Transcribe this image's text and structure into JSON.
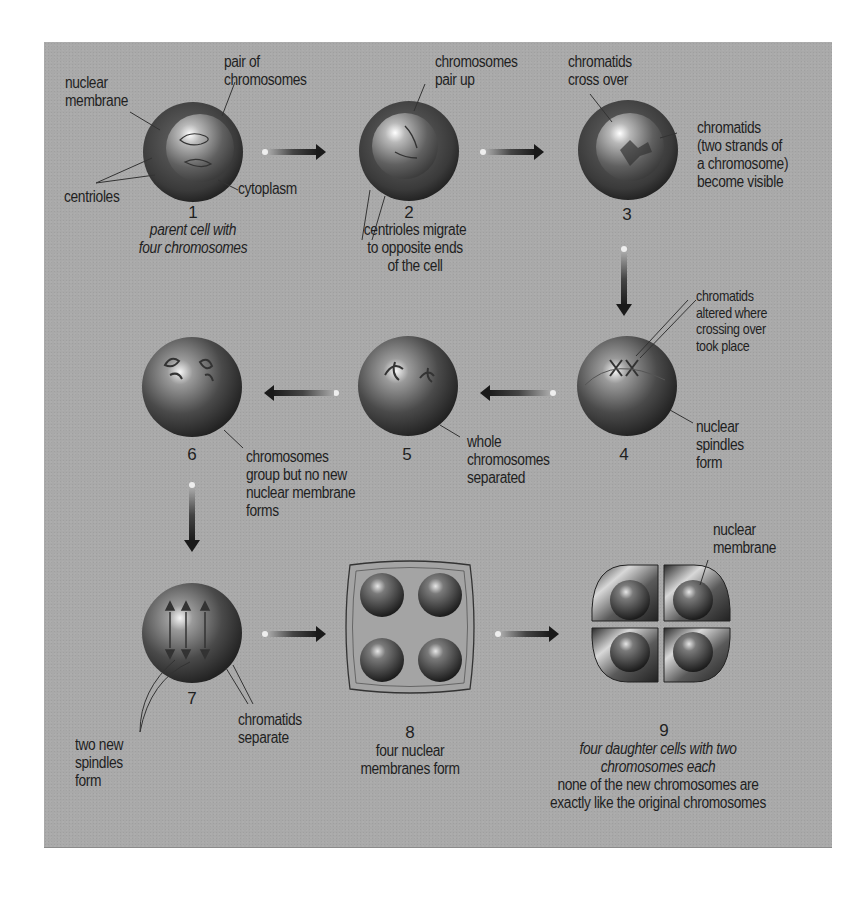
{
  "diagram": {
    "type": "process-flow",
    "topic": "Meiosis",
    "background_color": "#a9a9a9",
    "text_color": "#1f1f1f",
    "flow_order": [
      1,
      2,
      3,
      4,
      5,
      6,
      7,
      8,
      9
    ],
    "stages": [
      {
        "number": "1",
        "caption": "parent cell with\nfour chromosomes",
        "caption_style": "italic",
        "labels": {
          "nuclear_membrane": "nuclear\nmembrane",
          "pair_of_chromosomes": "pair of\nchromosomes",
          "centrioles": "centrioles",
          "cytoplasm": "cytoplasm"
        }
      },
      {
        "number": "2",
        "caption": "centrioles migrate\nto opposite ends\nof the cell",
        "labels": {
          "chromosomes_pair_up": "chromosomes\npair up"
        }
      },
      {
        "number": "3",
        "labels": {
          "chromatids_cross_over": "chromatids\ncross over",
          "chromatids_visible": "chromatids\n(two strands of\na chromosome)\nbecome visible"
        }
      },
      {
        "number": "4",
        "labels": {
          "chromatids_altered": "chromatids\naltered where\ncrossing over\ntook place",
          "nuclear_spindles": "nuclear\nspindles\nform"
        }
      },
      {
        "number": "5",
        "labels": {
          "whole_chromosomes": "whole\nchromosomes\nseparated"
        }
      },
      {
        "number": "6",
        "labels": {
          "chromosomes_group": "chromosomes\ngroup but no new\nnuclear membrane\nforms"
        }
      },
      {
        "number": "7",
        "labels": {
          "two_new_spindles": "two new\nspindles\nform",
          "chromatids_separate": "chromatids\nseparate"
        }
      },
      {
        "number": "8",
        "caption": "four nuclear\nmembranes form"
      },
      {
        "number": "9",
        "caption": "four daughter cells with two\nchromosomes each",
        "caption_style": "italic",
        "note": "none of the new chromosomes are\nexactly like the original chromosomes",
        "labels": {
          "nuclear_membrane": "nuclear\nmembrane"
        }
      }
    ],
    "arrows": [
      {
        "from": "1",
        "to": "2",
        "direction": "right"
      },
      {
        "from": "2",
        "to": "3",
        "direction": "right"
      },
      {
        "from": "3",
        "to": "4",
        "direction": "down"
      },
      {
        "from": "4",
        "to": "5",
        "direction": "left"
      },
      {
        "from": "5",
        "to": "6",
        "direction": "left"
      },
      {
        "from": "6",
        "to": "7",
        "direction": "down"
      },
      {
        "from": "7",
        "to": "8",
        "direction": "right"
      },
      {
        "from": "8",
        "to": "9",
        "direction": "right"
      }
    ]
  }
}
